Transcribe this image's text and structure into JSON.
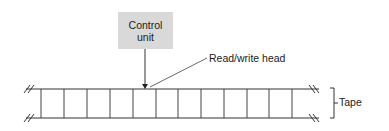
{
  "diagram": {
    "control_unit": {
      "line1": "Control",
      "line2": "unit"
    },
    "read_write_head_label": "Read/write head",
    "tape_label": "Tape",
    "tape": {
      "cell_count": 11,
      "top_y": 89,
      "bottom_y": 118,
      "divider_x": [
        41,
        64,
        87,
        110,
        133,
        156,
        178,
        201,
        224,
        247,
        269,
        292
      ]
    },
    "colors": {
      "line": "#333333",
      "control_box_fill": "#d9d9d9",
      "background": "#ffffff"
    }
  }
}
